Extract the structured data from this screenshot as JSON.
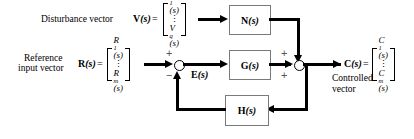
{
  "diagram": {
    "type": "control-system-block-diagram",
    "labels": {
      "disturbance_caption": "Disturbance vector",
      "reference_caption_line1": "Reference",
      "reference_caption_line2": "input vector",
      "controlled_caption_line1": "Controlled",
      "controlled_caption_line2": "vector",
      "equals": "="
    },
    "signals": {
      "disturbance": {
        "symbol": "V",
        "symbol_arg": "(s)",
        "matrix": {
          "first": "V",
          "first_sub": "1",
          "first_arg": "(s)",
          "dots": "⋮",
          "last": "V",
          "last_sub": "q",
          "last_arg": "(s)"
        }
      },
      "reference": {
        "symbol": "R",
        "symbol_arg": "(s)",
        "matrix": {
          "first": "R",
          "first_sub": "1",
          "first_arg": "(s)",
          "dots": "⋮",
          "last": "R",
          "last_sub": "m",
          "last_arg": "(s)"
        }
      },
      "controlled": {
        "symbol": "C",
        "symbol_arg": "(s)",
        "matrix": {
          "first": "C",
          "first_sub": "1",
          "first_arg": "(s)",
          "dots": "⋮",
          "last": "C",
          "last_sub": "m",
          "last_arg": "(s)"
        }
      },
      "error": {
        "symbol": "E",
        "symbol_arg": "(s)"
      }
    },
    "blocks": [
      {
        "id": "N",
        "symbol": "N",
        "arg": "(s)",
        "role": "disturbance-transfer"
      },
      {
        "id": "G",
        "symbol": "G",
        "arg": "(s)",
        "role": "forward-transfer"
      },
      {
        "id": "H",
        "symbol": "H",
        "arg": "(s)",
        "role": "feedback-transfer"
      }
    ],
    "summing_junctions": [
      {
        "id": "sum1",
        "signs": {
          "top": "+",
          "bottom": "−"
        },
        "output": "E(s)"
      },
      {
        "id": "sum2",
        "signs": {
          "top": "+",
          "bottom": "+"
        },
        "output": "C(s)"
      }
    ]
  }
}
